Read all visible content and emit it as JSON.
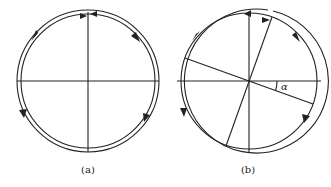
{
  "figure": {
    "panels": [
      {
        "id": "a",
        "caption": "(a)",
        "description": "Circle with horizontal and vertical diameters and a double-line ring with circulation arrows"
      },
      {
        "id": "b",
        "caption": "(b)",
        "description": "Circle with horizontal and vertical diameters plus a second pair of perpendicular diameters rotated by angle alpha; double-line ring with circulation arrows",
        "angle_label": "α"
      }
    ],
    "colors": {
      "stroke": "#222222",
      "background": "#ffffff"
    }
  }
}
